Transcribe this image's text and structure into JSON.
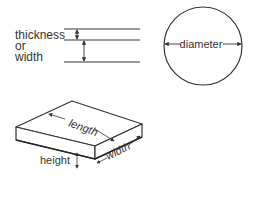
{
  "diagram": {
    "thickness_panel": {
      "label_lines": [
        "thickness",
        "or",
        "width"
      ]
    },
    "circle_panel": {
      "label": "diameter"
    },
    "box_panel": {
      "length_label": "length",
      "width_label": "width",
      "height_label": "height"
    },
    "colors": {
      "stroke": "#333333",
      "background": "#ffffff"
    }
  }
}
